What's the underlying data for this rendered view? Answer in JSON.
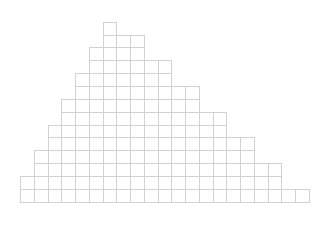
{
  "diagram": {
    "type": "block-histogram",
    "origin_x": 20,
    "baseline_y": 201.7,
    "cell_width": 13.75,
    "cell_height": 12.86,
    "line_color": "#d2d2d2",
    "column_heights": [
      2,
      4,
      6,
      8,
      10,
      12,
      14,
      13,
      13,
      11,
      11,
      9,
      9,
      7,
      7,
      5,
      5,
      3,
      3,
      1,
      1
    ]
  }
}
